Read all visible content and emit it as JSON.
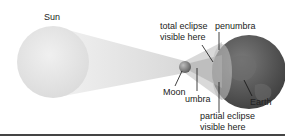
{
  "diagram": {
    "labels": {
      "sun": "Sun",
      "total_eclipse_line1": "total eclipse",
      "total_eclipse_line2": "visible here",
      "penumbra": "penumbra",
      "moon": "Moon",
      "umbra": "umbra",
      "earth": "Earth",
      "partial_eclipse_line1": "partial eclipse",
      "partial_eclipse_line2": "visible here"
    },
    "colors": {
      "sun": "#e6e6e6",
      "cone": "#ececec",
      "earth": "#5a5a5a",
      "moon": "#8a8a8a",
      "rule": "#444444"
    }
  }
}
